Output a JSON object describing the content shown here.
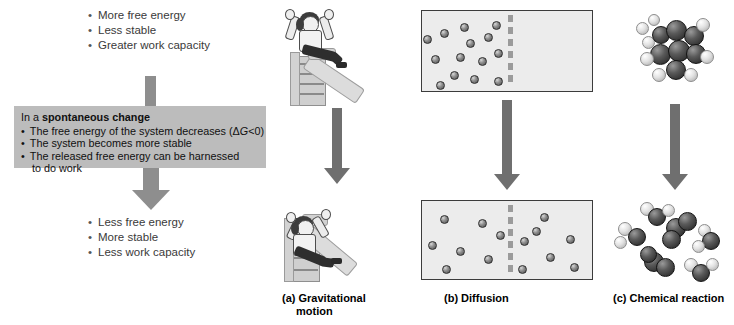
{
  "figure": {
    "title_implied": "Spontaneous change and free energy",
    "concept": {
      "top_bullets": [
        "More free energy",
        "Less stable",
        "Greater work capacity"
      ],
      "box": {
        "header_lead": "In a ",
        "header_bold": "spontaneous change",
        "bullets": [
          "The free energy of the system decreases (ΔG<0)",
          "The system becomes more stable",
          "The released free energy can be harnessed"
        ],
        "bullet_3_continuation": "to do work",
        "delta_g_prefix": "The free energy of the system decreases (Δ",
        "delta_g_italic": "G",
        "delta_g_suffix": "<0)",
        "background_color": "#bcbcbc"
      },
      "bottom_bullets": [
        "Less free energy",
        "More stable",
        "Less work capacity"
      ],
      "arrow_color": "#8e8e8e"
    },
    "panels": [
      {
        "id": "gravitational",
        "caption_line1": "(a) Gravitational",
        "caption_line2": "motion",
        "top_state": "person seated at top of slide with arms raised",
        "bottom_state": "person at bottom of slide with arms raised",
        "icon": "playground-slide-icon"
      },
      {
        "id": "diffusion",
        "caption_line1": "(b) Diffusion",
        "caption_line2": "",
        "top_state": "all particles confined to left compartment",
        "bottom_state": "particles evenly spread across both compartments",
        "particles_top_left": 14,
        "particles_top_right": 0,
        "particles_bottom_left": 7,
        "particles_bottom_right": 7,
        "barrier_style": "dashed",
        "box_fill": "#ececec"
      },
      {
        "id": "chemical",
        "caption_line1": "(c) Chemical reaction",
        "caption_line2": "",
        "top_state": "single large space-filling molecule cluster (reactant)",
        "bottom_state": "six small separated molecules (products)",
        "atom_dark_label": "carbon",
        "atom_light_label": "hydrogen"
      }
    ],
    "arrow_color_panels": "#6f6f6f"
  }
}
